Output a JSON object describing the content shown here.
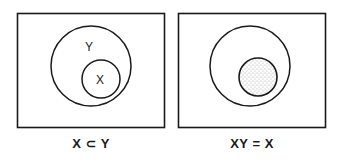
{
  "panels": [
    {
      "id": "subset",
      "caption": "X ⊂ Y",
      "outer_label": "Y",
      "inner_label": "X",
      "inner_shaded": false
    },
    {
      "id": "intersection",
      "caption": "XY = X",
      "outer_label": "",
      "inner_label": "",
      "inner_shaded": true
    }
  ],
  "colors": {
    "stroke": "#1a1a1a",
    "background": "#ffffff",
    "stipple": "#555555"
  }
}
